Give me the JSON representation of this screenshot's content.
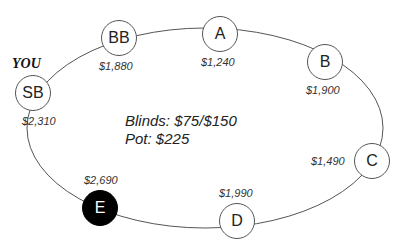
{
  "hero_label": "YOU",
  "info": {
    "blinds": "Blinds: $75/$150",
    "pot": "Pot: $225"
  },
  "seats": [
    {
      "position": "SB",
      "stack": "$2,310",
      "is_hero": true
    },
    {
      "position": "BB",
      "stack": "$1,880"
    },
    {
      "position": "A",
      "stack": "$1,240"
    },
    {
      "position": "B",
      "stack": "$1,900"
    },
    {
      "position": "C",
      "stack": "$1,490"
    },
    {
      "position": "D",
      "stack": "$1,990"
    },
    {
      "position": "E",
      "stack": "$2,690",
      "highlighted": true
    }
  ],
  "colors": {
    "line": "#555555",
    "highlight_fill": "#000000"
  }
}
